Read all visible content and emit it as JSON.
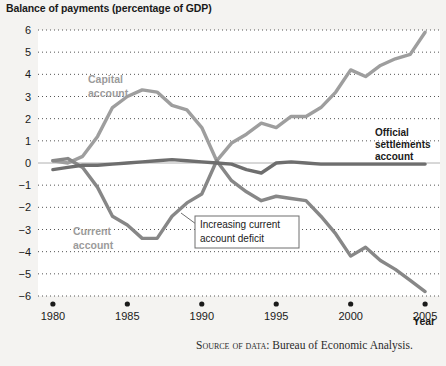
{
  "figure": {
    "title": "Balance of payments (percentage of GDP)",
    "source_prefix": "Source of data:",
    "source_text": "Bureau of Economic Analysis.",
    "background_color": "#f4f3f1",
    "plot_background_color": "#ffffff"
  },
  "labels": {
    "capital_account": "Capital\naccount",
    "capital_account_line1": "Capital",
    "capital_account_line2": "account",
    "current_account_line1": "Current",
    "current_account_line2": "account",
    "official_line1": "Official",
    "official_line2": "settlements",
    "official_line3": "account",
    "annotation_line1": "Increasing current",
    "annotation_line2": "account deficit",
    "x_axis_name": "Year"
  },
  "colors": {
    "capital_account": "#9e9e9e",
    "current_account": "#878787",
    "official_settlements": "#6e6e6e",
    "gridline": "#555555",
    "zero_line": "#b0b0b0",
    "text": "#1a1a1a",
    "series_label": "#9b9b9b"
  },
  "chart_data": {
    "type": "line",
    "title": "Balance of payments (percentage of GDP)",
    "xlabel": "Year",
    "ylabel": "",
    "xlim": [
      1979,
      2006
    ],
    "ylim": [
      -6,
      6
    ],
    "grid": true,
    "legend_position": "inline-annotations",
    "x_ticks": [
      1980,
      1985,
      1990,
      1995,
      2000,
      2005
    ],
    "y_ticks": [
      -6,
      -5,
      -4,
      -3,
      -2,
      -1,
      0,
      1,
      2,
      3,
      4,
      5,
      6
    ],
    "x": [
      1980,
      1981,
      1982,
      1983,
      1984,
      1985,
      1986,
      1987,
      1988,
      1989,
      1990,
      1991,
      1992,
      1993,
      1994,
      1995,
      1996,
      1997,
      1998,
      1999,
      2000,
      2001,
      2002,
      2003,
      2004,
      2005
    ],
    "series": [
      {
        "name": "Capital account",
        "color": "#9e9e9e",
        "values": [
          0.1,
          0.0,
          0.3,
          1.2,
          2.5,
          3.0,
          3.3,
          3.2,
          2.6,
          2.4,
          1.6,
          0.1,
          0.9,
          1.3,
          1.8,
          1.6,
          2.1,
          2.1,
          2.5,
          3.2,
          4.2,
          3.9,
          4.4,
          4.7,
          4.9,
          5.9
        ]
      },
      {
        "name": "Current account",
        "color": "#878787",
        "values": [
          0.1,
          0.2,
          -0.2,
          -1.1,
          -2.4,
          -2.8,
          -3.4,
          -3.4,
          -2.4,
          -1.8,
          -1.4,
          0.1,
          -0.8,
          -1.3,
          -1.7,
          -1.5,
          -1.6,
          -1.7,
          -2.4,
          -3.2,
          -4.2,
          -3.8,
          -4.4,
          -4.8,
          -5.3,
          -5.8
        ]
      },
      {
        "name": "Official settlements account",
        "color": "#6e6e6e",
        "values": [
          -0.3,
          -0.2,
          -0.1,
          -0.1,
          -0.05,
          0.0,
          0.05,
          0.1,
          0.15,
          0.1,
          0.05,
          0.0,
          -0.05,
          -0.3,
          -0.45,
          0.0,
          0.05,
          0.0,
          -0.05,
          -0.05,
          -0.05,
          -0.05,
          -0.05,
          -0.05,
          -0.05,
          -0.05
        ]
      }
    ],
    "annotations": [
      {
        "text": "Increasing current account deficit",
        "points_to_year": 1988,
        "points_to_value": -2.3
      },
      {
        "text": "Capital account",
        "at_year": 1984,
        "at_value": 4.0
      },
      {
        "text": "Current account",
        "at_year": 1983,
        "at_value": -3.2
      },
      {
        "text": "Official settlements account",
        "at_year": 2004,
        "at_value": 1.1
      }
    ]
  }
}
